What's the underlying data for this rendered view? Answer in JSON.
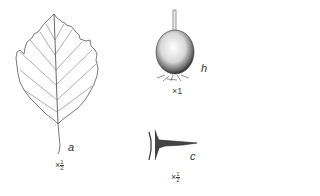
{
  "figures": [
    {
      "id": "a",
      "subject": "leaf",
      "label": "a",
      "scale_prefix": "×",
      "scale_num": "1",
      "scale_den": "2"
    },
    {
      "id": "h",
      "subject": "fruit",
      "label": "h",
      "scale": "×1"
    },
    {
      "id": "c",
      "subject": "thorn",
      "label": "c",
      "scale_prefix": "×",
      "scale_num": "1",
      "scale_den": "2"
    }
  ],
  "colors": {
    "line": "#555555",
    "background": "#ffffff"
  }
}
